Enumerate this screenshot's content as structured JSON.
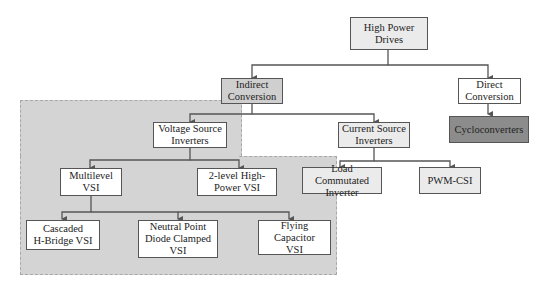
{
  "diagram": {
    "nodes": {
      "root": {
        "label": "High Power\nDrives"
      },
      "indirect": {
        "label": "Indirect\nConversion"
      },
      "direct": {
        "label": "Direct\nConversion"
      },
      "cyclo": {
        "label": "Cycloconverters"
      },
      "vsi": {
        "label": "Voltage Source\nInverters"
      },
      "csi": {
        "label": "Current Source\nInverters"
      },
      "multilevel": {
        "label": "Multilevel\nVSI"
      },
      "twolevel": {
        "label": "2-level High-\nPower VSI"
      },
      "lci": {
        "label": "Load Commutated\nInverter"
      },
      "pwmcsi": {
        "label": "PWM-CSI"
      },
      "chb": {
        "label": "Cascaded\nH-Bridge VSI"
      },
      "npc": {
        "label": "Neutral Point\nDiode Clamped\nVSI"
      },
      "fc": {
        "label": "Flying Capacitor\nVSI"
      }
    },
    "edges": [
      [
        "root",
        "indirect"
      ],
      [
        "root",
        "direct"
      ],
      [
        "direct",
        "cyclo"
      ],
      [
        "indirect",
        "vsi"
      ],
      [
        "indirect",
        "csi"
      ],
      [
        "vsi",
        "multilevel"
      ],
      [
        "vsi",
        "twolevel"
      ],
      [
        "csi",
        "lci"
      ],
      [
        "csi",
        "pwmcsi"
      ],
      [
        "multilevel",
        "chb"
      ],
      [
        "multilevel",
        "npc"
      ],
      [
        "multilevel",
        "fc"
      ]
    ],
    "colors": {
      "highlight_region": "#d4d4d4",
      "cyclo_fill": "#8c8c8c",
      "border": "#555555"
    }
  }
}
